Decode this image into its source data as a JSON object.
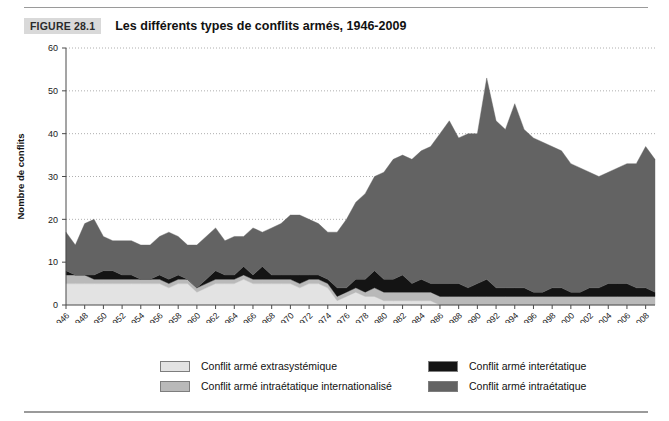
{
  "figure": {
    "tag": "FIGURE 28.1",
    "title": "Les différents types de conflits armés, 1946-2009"
  },
  "legend": {
    "items": [
      {
        "label": "Conflit armé extrasystémique",
        "color": "#e3e3e3",
        "column": "left"
      },
      {
        "label": "Conflit armé intraétatique internationalisé",
        "color": "#b9b9b9",
        "column": "left"
      },
      {
        "label": "Conflit armé interétatique",
        "color": "#141414",
        "column": "right"
      },
      {
        "label": "Conflit armé intraétatique",
        "color": "#636363",
        "column": "right"
      }
    ]
  },
  "chart_data": {
    "type": "area",
    "stacked": true,
    "title": "Les différents types de conflits armés, 1946-2009",
    "xlabel": "Année",
    "ylabel": "Nombre de conflits",
    "xlim": [
      1946,
      2009
    ],
    "ylim": [
      0,
      60
    ],
    "yticks": [
      0,
      10,
      20,
      30,
      40,
      50,
      60
    ],
    "grid": "horizontal-dotted",
    "legend_position": "bottom",
    "x": [
      1946,
      1947,
      1948,
      1949,
      1950,
      1951,
      1952,
      1953,
      1954,
      1955,
      1956,
      1957,
      1958,
      1959,
      1960,
      1961,
      1962,
      1963,
      1964,
      1965,
      1966,
      1967,
      1968,
      1969,
      1970,
      1971,
      1972,
      1973,
      1974,
      1975,
      1976,
      1977,
      1978,
      1979,
      1980,
      1981,
      1982,
      1983,
      1984,
      1985,
      1986,
      1987,
      1988,
      1989,
      1990,
      1991,
      1992,
      1993,
      1994,
      1995,
      1996,
      1997,
      1998,
      1999,
      2000,
      2001,
      2002,
      2003,
      2004,
      2005,
      2006,
      2007,
      2008,
      2009
    ],
    "xtick_labels": [
      "1946",
      "1948",
      "1950",
      "1952",
      "1954",
      "1956",
      "1958",
      "1960",
      "1962",
      "1964",
      "1966",
      "1968",
      "1970",
      "1972",
      "1974",
      "1976",
      "1978",
      "1980",
      "1982",
      "1984",
      "1986",
      "1988",
      "1990",
      "1992",
      "1994",
      "1996",
      "1998",
      "2000",
      "2002",
      "2004",
      "2006",
      "2008"
    ],
    "series": [
      {
        "name": "Conflit armé extrasystémique",
        "color": "#e3e3e3",
        "values": [
          5,
          5,
          5,
          5,
          5,
          5,
          5,
          5,
          5,
          5,
          5,
          4,
          5,
          5,
          3,
          4,
          5,
          5,
          5,
          6,
          5,
          5,
          5,
          5,
          5,
          4,
          5,
          5,
          4,
          1,
          2,
          3,
          2,
          2,
          1,
          1,
          1,
          1,
          1,
          1,
          0,
          0,
          0,
          0,
          0,
          0,
          0,
          0,
          0,
          0,
          0,
          0,
          0,
          0,
          0,
          0,
          0,
          0,
          0,
          0,
          0,
          0,
          0,
          0
        ]
      },
      {
        "name": "Conflit armé intraétatique internationalisé",
        "color": "#b9b9b9",
        "values": [
          2,
          2,
          2,
          1,
          1,
          1,
          1,
          1,
          1,
          1,
          1,
          1,
          1,
          1,
          1,
          1,
          1,
          1,
          1,
          1,
          1,
          1,
          1,
          1,
          1,
          1,
          1,
          1,
          1,
          1,
          1,
          1,
          1,
          2,
          2,
          2,
          2,
          2,
          2,
          2,
          2,
          2,
          2,
          2,
          2,
          2,
          2,
          2,
          2,
          2,
          2,
          2,
          2,
          2,
          2,
          2,
          2,
          2,
          2,
          2,
          2,
          2,
          2,
          2
        ]
      },
      {
        "name": "Conflit armé interétatique",
        "color": "#141414",
        "values": [
          1,
          0,
          0,
          1,
          2,
          2,
          1,
          1,
          0,
          0,
          1,
          1,
          1,
          0,
          0,
          1,
          2,
          1,
          1,
          2,
          1,
          3,
          1,
          1,
          1,
          2,
          1,
          1,
          1,
          2,
          1,
          2,
          3,
          4,
          3,
          3,
          4,
          2,
          3,
          2,
          3,
          3,
          3,
          2,
          3,
          4,
          2,
          2,
          2,
          2,
          1,
          1,
          2,
          2,
          1,
          1,
          2,
          2,
          3,
          3,
          3,
          2,
          2,
          1
        ]
      },
      {
        "name": "Conflit armé intraétatique",
        "color": "#636363",
        "values": [
          9,
          7,
          12,
          13,
          8,
          7,
          8,
          8,
          8,
          8,
          9,
          11,
          9,
          8,
          10,
          10,
          10,
          8,
          9,
          7,
          11,
          8,
          11,
          12,
          14,
          14,
          13,
          12,
          11,
          13,
          16,
          18,
          20,
          22,
          25,
          28,
          28,
          29,
          30,
          32,
          35,
          38,
          34,
          36,
          35,
          47,
          39,
          37,
          43,
          37,
          36,
          35,
          33,
          32,
          30,
          29,
          27,
          26,
          26,
          27,
          28,
          29,
          33,
          31
        ]
      }
    ],
    "totals_note": "Le total des conflits culmine à environ 53 en 1991 et redescend à environ 36 en 2008."
  }
}
